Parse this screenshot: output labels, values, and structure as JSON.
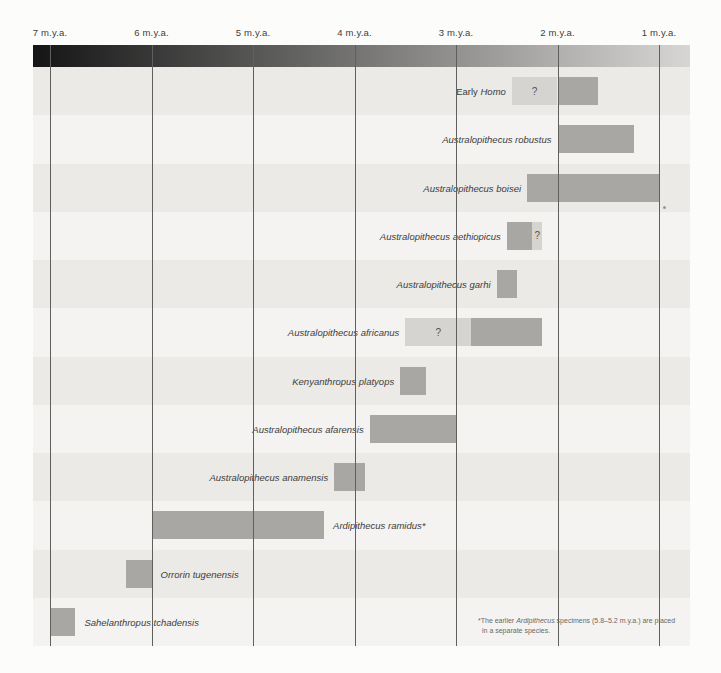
{
  "colors": {
    "page_bg": "#fcfcfb",
    "band_dark": "#ebeae7",
    "band_light": "#f4f3f1",
    "bar_solid": "#a8a7a4",
    "bar_uncertain": "#d6d4d0",
    "gridline": "#5f5f5d",
    "gradient_start": "#151515",
    "gradient_end": "#d7d6d4",
    "label_text": "#3c3c3c",
    "footnote_text": "#6b6967"
  },
  "axis": {
    "tick_values": [
      7,
      6,
      5,
      4,
      3,
      2,
      1
    ],
    "tick_labels": [
      "7 m.y.a.",
      "6 m.y.a.",
      "5 m.y.a.",
      "4 m.y.a.",
      "3 m.y.a.",
      "2 m.y.a.",
      "1 m.y.a."
    ]
  },
  "footnote": {
    "line1_parts": [
      {
        "text": "*The earlier ",
        "italic": false
      },
      {
        "text": "Ardipithecus",
        "italic": true
      },
      {
        "text": " specimens (5.8–5.2 m.y.a.) are placed",
        "italic": false
      }
    ],
    "line2": "in a separate species."
  },
  "chart_data": {
    "type": "bar",
    "xlabel": "m.y.a. (millions of years ago)",
    "x_range": [
      7.17,
      0.7
    ],
    "x_ticks": [
      7,
      6,
      5,
      4,
      3,
      2,
      1
    ],
    "uncertain_marker": "?",
    "rows": [
      {
        "name": "Early Homo",
        "label_parts": [
          {
            "text": "Early ",
            "italic": false
          },
          {
            "text": "Homo",
            "italic": true
          }
        ],
        "label_side": "left",
        "segments": [
          {
            "start": 2.45,
            "end": 2.0,
            "certain": false,
            "label": "?"
          },
          {
            "start": 2.0,
            "end": 1.6,
            "certain": true
          }
        ]
      },
      {
        "name": "Australopithecus robustus",
        "label_parts": [
          {
            "text": "Australopithecus robustus",
            "italic": true
          }
        ],
        "label_side": "left",
        "segments": [
          {
            "start": 2.0,
            "end": 1.25,
            "certain": true
          }
        ]
      },
      {
        "name": "Australopithecus boisei",
        "label_parts": [
          {
            "text": "Australopithecus boisei",
            "italic": true
          }
        ],
        "label_side": "left",
        "segments": [
          {
            "start": 2.3,
            "end": 1.0,
            "certain": true
          }
        ]
      },
      {
        "name": "Australopithecus aethiopicus",
        "label_parts": [
          {
            "text": "Australopithecus aethiopicus",
            "italic": true
          }
        ],
        "label_side": "left",
        "segments": [
          {
            "start": 2.5,
            "end": 2.25,
            "certain": true
          },
          {
            "start": 2.25,
            "end": 2.15,
            "certain": false,
            "label": "?"
          }
        ]
      },
      {
        "name": "Australopithecus garhi",
        "label_parts": [
          {
            "text": "Australopithecus garhi",
            "italic": true
          }
        ],
        "label_side": "left",
        "segments": [
          {
            "start": 2.6,
            "end": 2.4,
            "certain": true
          }
        ]
      },
      {
        "name": "Australopithecus africanus",
        "label_parts": [
          {
            "text": "Australopithecus africanus",
            "italic": true
          }
        ],
        "label_side": "left",
        "segments": [
          {
            "start": 3.5,
            "end": 2.85,
            "certain": false,
            "label": "?"
          },
          {
            "start": 2.85,
            "end": 2.15,
            "certain": true
          }
        ]
      },
      {
        "name": "Kenyanthropus platyops",
        "label_parts": [
          {
            "text": "Kenyanthropus platyops",
            "italic": true
          }
        ],
        "label_side": "left",
        "segments": [
          {
            "start": 3.55,
            "end": 3.3,
            "certain": true
          }
        ]
      },
      {
        "name": "Australopithecus afarensis",
        "label_parts": [
          {
            "text": "Australopithecus afarensis",
            "italic": true
          }
        ],
        "label_side": "left",
        "segments": [
          {
            "start": 3.85,
            "end": 3.0,
            "certain": true
          }
        ]
      },
      {
        "name": "Australopithecus anamensis",
        "label_parts": [
          {
            "text": "Australopithecus anamensis",
            "italic": true
          }
        ],
        "label_side": "left",
        "segments": [
          {
            "start": 4.2,
            "end": 3.9,
            "certain": true
          }
        ]
      },
      {
        "name": "Ardipithecus ramidus*",
        "label_parts": [
          {
            "text": "Ardipithecus ramidus*",
            "italic": true
          }
        ],
        "label_side": "right",
        "segments": [
          {
            "start": 6.0,
            "end": 4.3,
            "certain": true
          }
        ]
      },
      {
        "name": "Orrorin tugenensis",
        "label_parts": [
          {
            "text": "Orrorin tugenensis",
            "italic": true
          }
        ],
        "label_side": "right",
        "segments": [
          {
            "start": 6.25,
            "end": 6.0,
            "certain": true
          }
        ]
      },
      {
        "name": "Sahelanthropus tchadensis",
        "label_parts": [
          {
            "text": "Sahelanthropus tchadensis",
            "italic": true
          }
        ],
        "label_side": "right",
        "segments": [
          {
            "start": 7.0,
            "end": 6.75,
            "certain": true
          }
        ]
      }
    ]
  }
}
